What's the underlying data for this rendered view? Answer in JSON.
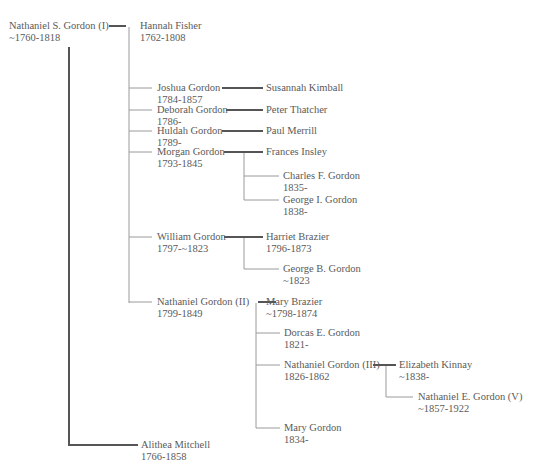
{
  "tree": {
    "title": "Gordon family tree",
    "people": [
      {
        "id": "nathaniel_s",
        "name": "Nathaniel S. Gordon (I)",
        "dates": "~1760-1818"
      },
      {
        "id": "hannah",
        "name": "Hannah Fisher",
        "dates": "1762-1808"
      },
      {
        "id": "joshua",
        "name": "Joshua Gordon",
        "dates": "1784-1857"
      },
      {
        "id": "susannah",
        "name": "Susannah Kimball",
        "dates": ""
      },
      {
        "id": "deborah",
        "name": "Deborah Gordon",
        "dates": "1786-"
      },
      {
        "id": "peter",
        "name": "Peter Thatcher",
        "dates": ""
      },
      {
        "id": "huldah",
        "name": "Huldah Gordon",
        "dates": "1789-"
      },
      {
        "id": "paul",
        "name": "Paul Merrill",
        "dates": ""
      },
      {
        "id": "morgan",
        "name": "Morgan Gordon",
        "dates": "1793-1845"
      },
      {
        "id": "frances",
        "name": "Frances Insley",
        "dates": ""
      },
      {
        "id": "charles",
        "name": "Charles F. Gordon",
        "dates": "1835-"
      },
      {
        "id": "george_i",
        "name": "George I. Gordon",
        "dates": "1838-"
      },
      {
        "id": "william",
        "name": "William Gordon",
        "dates": "1797-~1823"
      },
      {
        "id": "harriet",
        "name": "Harriet Brazier",
        "dates": "1796-1873"
      },
      {
        "id": "george_b",
        "name": "George B. Gordon",
        "dates": "~1823"
      },
      {
        "id": "nathaniel_ii",
        "name": "Nathaniel Gordon (II)",
        "dates": "1799-1849"
      },
      {
        "id": "mary_brazier",
        "name": "Mary Brazier",
        "dates": "~1798-1874"
      },
      {
        "id": "dorcas",
        "name": "Dorcas E. Gordon",
        "dates": "1821-"
      },
      {
        "id": "nathaniel_iii",
        "name": "Nathaniel Gordon (III)",
        "dates": "1826-1862"
      },
      {
        "id": "elizabeth",
        "name": "Elizabeth Kinnay",
        "dates": "~1838-"
      },
      {
        "id": "nathaniel_v",
        "name": "Nathaniel E. Gordon (V)",
        "dates": "~1857-1922"
      },
      {
        "id": "mary_gordon",
        "name": "Mary Gordon",
        "dates": "1834-"
      },
      {
        "id": "alithea",
        "name": "Alithea Mitchell",
        "dates": "1766-1858"
      }
    ]
  }
}
